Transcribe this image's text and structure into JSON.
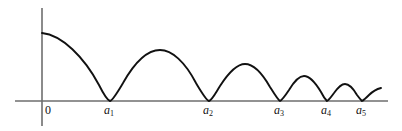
{
  "figure": {
    "background_color": "#ffffff",
    "curve_color": "#111111",
    "axis_color": "#6e6e6e",
    "label_color": "#141414"
  },
  "axes": {
    "x_axis": {
      "name": "horizontal-axis",
      "y": 101,
      "x_start": 15,
      "x_end": 388
    },
    "y_axis": {
      "name": "vertical-axis",
      "x": 42,
      "y_start": 8,
      "y_end": 126
    }
  },
  "tick_labels": [
    {
      "id": "origin",
      "text": "0",
      "italic": false,
      "subscript": "",
      "x": 45,
      "y": 104
    },
    {
      "id": "a1",
      "text": "a",
      "italic": true,
      "subscript": "1",
      "x": 104,
      "y": 104
    },
    {
      "id": "a2",
      "text": "a",
      "italic": true,
      "subscript": "2",
      "x": 203,
      "y": 104
    },
    {
      "id": "a3",
      "text": "a",
      "italic": true,
      "subscript": "3",
      "x": 274,
      "y": 104
    },
    {
      "id": "a4",
      "text": "a",
      "italic": true,
      "subscript": "4",
      "x": 321,
      "y": 104
    },
    {
      "id": "a5",
      "text": "a",
      "italic": true,
      "subscript": "5",
      "x": 356,
      "y": 104
    }
  ],
  "chart_data": {
    "type": "line",
    "title": "",
    "subtitle": "",
    "xlabel": "",
    "ylabel": "",
    "grid": false,
    "legend": "none",
    "xlim": [
      0,
      402
    ],
    "ylim": [
      0,
      70
    ],
    "x_tick_labels": [
      "0",
      "a1",
      "a2",
      "a3",
      "a4",
      "a5"
    ],
    "y_tick_labels": [],
    "zeros": {
      "names": [
        "a1",
        "a2",
        "a3",
        "a4",
        "a5"
      ],
      "x_pixels": [
        110,
        209,
        280,
        327,
        362
      ]
    },
    "arches": [
      {
        "index": 0,
        "start_x": 42,
        "end_x": 110,
        "peak_x": 42,
        "peak_y_pixel": 33,
        "peak_height": 68,
        "note": "initial descending branch starting at the vertical axis"
      },
      {
        "index": 1,
        "start_x": 110,
        "end_x": 209,
        "peak_x": 160,
        "peak_y_pixel": 50,
        "peak_height": 51
      },
      {
        "index": 2,
        "start_x": 209,
        "end_x": 280,
        "peak_x": 245,
        "peak_y_pixel": 64,
        "peak_height": 37
      },
      {
        "index": 3,
        "start_x": 280,
        "end_x": 327,
        "peak_x": 304,
        "peak_y_pixel": 76,
        "peak_height": 25
      },
      {
        "index": 4,
        "start_x": 327,
        "end_x": 362,
        "peak_x": 345,
        "peak_y_pixel": 84,
        "peak_height": 17
      },
      {
        "index": 5,
        "start_x": 362,
        "end_x": 381,
        "peak_x": 381,
        "peak_y_pixel": 88,
        "peak_height": 13,
        "note": "final partial rising branch, truncated at the right edge"
      }
    ],
    "series": [
      {
        "name": "curve",
        "x": [
          42,
          110,
          160,
          209,
          245,
          280,
          304,
          327,
          345,
          362,
          381
        ],
        "y": [
          68,
          0,
          51,
          0,
          37,
          0,
          25,
          0,
          17,
          0,
          13
        ]
      }
    ]
  }
}
